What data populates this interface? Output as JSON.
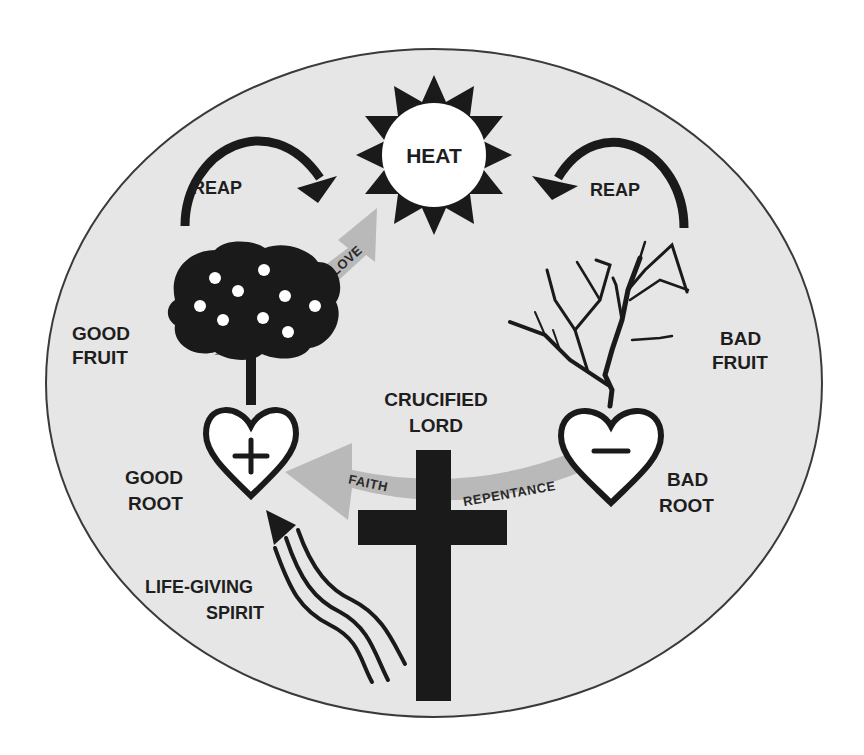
{
  "diagram": {
    "colors": {
      "background": "#ffffff",
      "ellipse_fill": "#e6e6e6",
      "ellipse_stroke": "#3a3a3a",
      "ink": "#1a1a1a",
      "band_gray": "#b9b9b9",
      "white": "#ffffff"
    },
    "sun": {
      "label": "HEAT",
      "icon": "sun-icon"
    },
    "reap_left": {
      "label": "REAP",
      "icon": "curved-arrow-right-icon"
    },
    "reap_right": {
      "label": "REAP",
      "icon": "curved-arrow-left-icon"
    },
    "love_arrow": {
      "label": "LOVE"
    },
    "good_tree": {
      "label_line1": "GOOD",
      "label_line2": "FRUIT",
      "icon": "fruit-tree-icon"
    },
    "bad_tree": {
      "label_line1": "BAD",
      "label_line2": "FRUIT",
      "icon": "bare-tree-icon"
    },
    "good_heart": {
      "label_line1": "GOOD",
      "label_line2": "ROOT",
      "symbol": "+",
      "icon": "heart-plus-icon"
    },
    "bad_heart": {
      "label_line1": "BAD",
      "label_line2": "ROOT",
      "symbol": "−",
      "icon": "heart-minus-icon"
    },
    "cross": {
      "label_line1": "CRUCIFIED",
      "label_line2": "LORD",
      "icon": "cross-icon"
    },
    "conversion_band": {
      "left_label": "FAITH",
      "right_label": "REPENTANCE"
    },
    "spirit": {
      "label_line1": "LIFE-GIVING",
      "label_line2": "SPIRIT",
      "icon": "wind-arrow-icon"
    }
  }
}
